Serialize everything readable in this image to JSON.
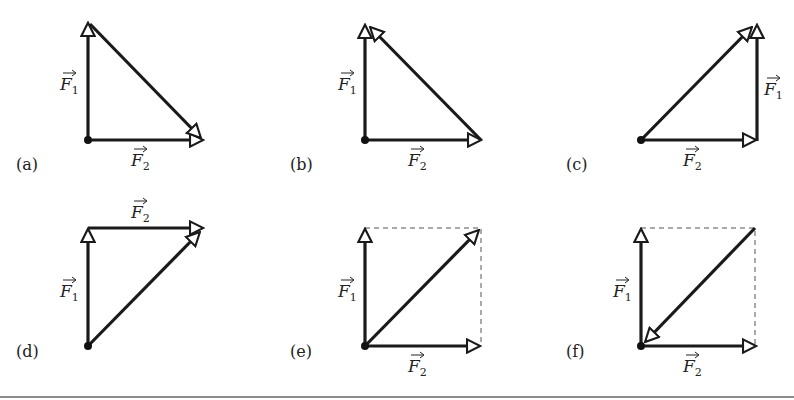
{
  "figure": {
    "vector_labels": {
      "f1": "F",
      "f1_sub": "1",
      "f2": "F",
      "f2_sub": "2"
    },
    "panels": [
      {
        "id": "a",
        "caption": "(a)",
        "description": "F1 up, F2 right from common origin; resultant drawn from tip of F1 to tip of F2 (arrow at F2 tip)"
      },
      {
        "id": "b",
        "caption": "(b)",
        "description": "F1 up, F2 right from common origin; line from tip of F2 to tip of F1 (arrow at F1 tip)"
      },
      {
        "id": "c",
        "caption": "(c)",
        "description": "F2 right from origin, F1 up from tip of F2 (head-to-tail); resultant from origin to tip of F1"
      },
      {
        "id": "d",
        "caption": "(d)",
        "description": "F1 up from origin, F2 right from tip of F1 (head-to-tail); resultant from origin to tip of F2"
      },
      {
        "id": "e",
        "caption": "(e)",
        "description": "Parallelogram: F1 up, F2 right from origin, dashed completion; resultant diagonal from origin to far corner"
      },
      {
        "id": "f",
        "caption": "(f)",
        "description": "Parallelogram: F1 up, F2 right from origin, dashed completion; diagonal drawn from far corner pointing back to origin"
      }
    ]
  }
}
